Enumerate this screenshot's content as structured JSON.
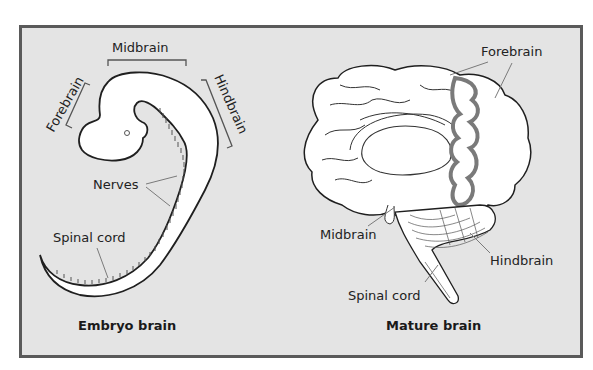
{
  "figure": {
    "colors": {
      "background": "#e4e4e4",
      "border": "#5a5a5a",
      "outline": "#1f1f1f",
      "leader": "#7a7a7a",
      "forebrain_section": "#8a8a8a"
    },
    "embryo": {
      "caption": "Embryo brain",
      "labels": {
        "midbrain": "Midbrain",
        "forebrain": "Forebrain",
        "hindbrain": "Hindbrain",
        "nerves": "Nerves",
        "spinal_cord": "Spinal cord"
      }
    },
    "mature": {
      "caption": "Mature brain",
      "labels": {
        "forebrain": "Forebrain",
        "midbrain": "Midbrain",
        "hindbrain": "Hindbrain",
        "spinal_cord": "Spinal cord"
      }
    }
  }
}
